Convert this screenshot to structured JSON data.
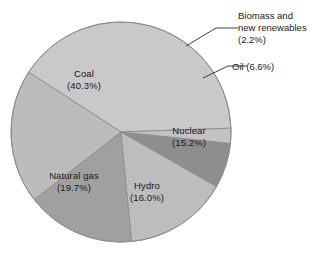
{
  "chart_data": {
    "type": "pie",
    "title": "",
    "subtitle": "",
    "xlabel": "",
    "ylabel": "",
    "legend_position": "none",
    "grid": false,
    "value_unit": "percent",
    "total": 100.0,
    "start_angle_deg": -2,
    "direction": "counterclockwise",
    "categories": [
      "Coal",
      "Natural gas",
      "Hydro",
      "Nuclear",
      "Oil",
      "Biomass and new renewables"
    ],
    "values": [
      40.3,
      19.7,
      16.0,
      15.2,
      6.6,
      2.2
    ],
    "slices": [
      {
        "name": "Coal",
        "label": "Coal",
        "value": 40.3,
        "value_text": "(40.3%)",
        "color": "#c9c9c9",
        "label_placement": "inside"
      },
      {
        "name": "Natural gas",
        "label": "Natural gas",
        "value": 19.7,
        "value_text": "(19.7%)",
        "color": "#bcbcbc",
        "label_placement": "inside"
      },
      {
        "name": "Hydro",
        "label": "Hydro",
        "value": 16.0,
        "value_text": "(16.0%)",
        "color": "#a0a0a0",
        "label_placement": "inside"
      },
      {
        "name": "Nuclear",
        "label": "Nuclear",
        "value": 15.2,
        "value_text": "(15.2%)",
        "color": "#bdbdbd",
        "label_placement": "inside"
      },
      {
        "name": "Oil",
        "label": "Oil (6.6%)",
        "value": 6.6,
        "value_text": "(6.6%)",
        "color": "#8e8e8e",
        "label_placement": "callout"
      },
      {
        "name": "Biomass and new renewables",
        "label_line1": "Biomass and",
        "label_line2": "new renewables",
        "label_line3": "(2.2%)",
        "value": 2.2,
        "value_text": "(2.2%)",
        "color": "#c2c2c2",
        "label_placement": "callout"
      }
    ],
    "geometry": {
      "center_x": 121,
      "center_y": 132,
      "radius": 110
    },
    "colors": {
      "background": "#ffffff",
      "outline": "#8d8d8d",
      "leader_line": "#303030",
      "text": "#1a1a1a"
    }
  }
}
